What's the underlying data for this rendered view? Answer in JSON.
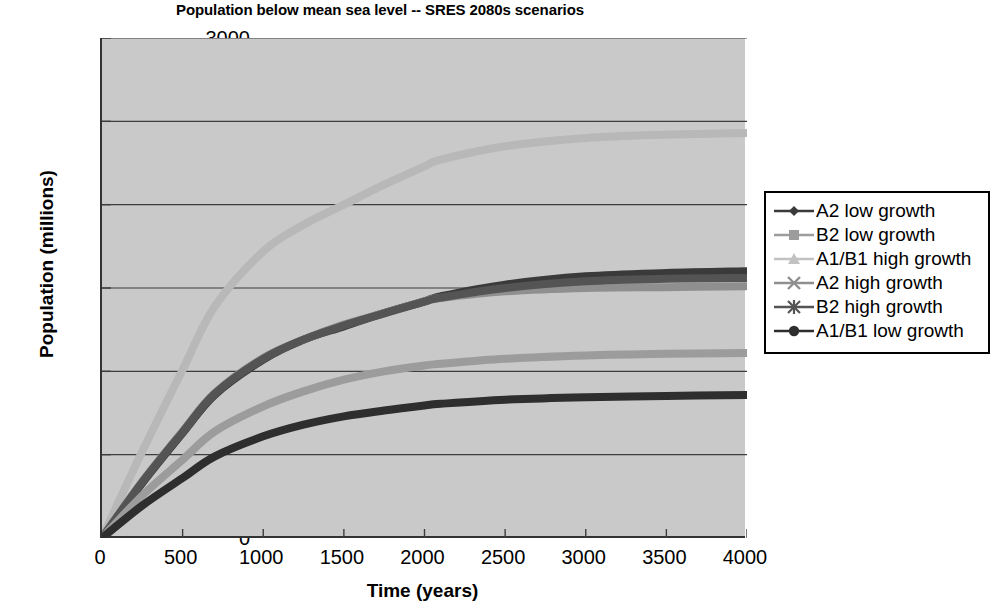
{
  "chart_data": {
    "type": "line",
    "title": "Population below mean sea level -- SRES 2080s scenarios",
    "xlabel": "Time (years)",
    "ylabel": "Population (millions)",
    "xlim": [
      0,
      4000
    ],
    "ylim": [
      0,
      3000
    ],
    "xticks": [
      0,
      500,
      1000,
      1500,
      2000,
      2500,
      3000,
      3500,
      4000
    ],
    "yticks": [
      0,
      500,
      1000,
      1500,
      2000,
      2500,
      3000
    ],
    "grid": "horizontal",
    "legend_position": "right",
    "plot_background": "#c9c9c9",
    "x": [
      0,
      250,
      500,
      700,
      1000,
      1250,
      1500,
      1750,
      2000,
      2100,
      2500,
      3000,
      3500,
      4000
    ],
    "series": [
      {
        "name": "A1/B1 high growth",
        "marker": "triangle",
        "color": "#b8b8b8",
        "values": [
          0,
          520,
          1010,
          1390,
          1720,
          1880,
          2000,
          2120,
          2230,
          2270,
          2350,
          2400,
          2420,
          2430
        ]
      },
      {
        "name": "A2 low growth",
        "marker": "diamond",
        "color": "#3a3a3a",
        "values": [
          0,
          330,
          630,
          860,
          1070,
          1190,
          1270,
          1350,
          1420,
          1450,
          1520,
          1570,
          1590,
          1600
        ]
      },
      {
        "name": "A2 high growth",
        "marker": "x",
        "color": "#8f8f8f",
        "values": [
          0,
          340,
          640,
          870,
          1080,
          1190,
          1280,
          1350,
          1420,
          1440,
          1480,
          1500,
          1505,
          1510
        ]
      },
      {
        "name": "B2 high growth",
        "marker": "asterisk",
        "color": "#545454",
        "values": [
          0,
          335,
          635,
          865,
          1075,
          1190,
          1275,
          1348,
          1418,
          1442,
          1500,
          1540,
          1555,
          1560
        ]
      },
      {
        "name": "B2 low growth",
        "marker": "square",
        "color": "#9c9c9c",
        "values": [
          0,
          255,
          470,
          640,
          790,
          880,
          950,
          1000,
          1035,
          1045,
          1075,
          1095,
          1105,
          1110
        ]
      },
      {
        "name": "A1/B1 low growth",
        "marker": "circle",
        "color": "#2e2e2e",
        "values": [
          0,
          195,
          360,
          490,
          610,
          680,
          730,
          765,
          795,
          805,
          830,
          845,
          852,
          858
        ]
      }
    ]
  },
  "axis": {
    "yticks": [
      "3000",
      "2500",
      "2000",
      "1500",
      "1000",
      "500",
      "0"
    ],
    "xticks": [
      "0",
      "500",
      "1000",
      "1500",
      "2000",
      "2500",
      "3000",
      "3500",
      "4000"
    ],
    "xlabel": "Time (years)",
    "ylabel": "Population (millions)"
  },
  "legend": {
    "items": [
      {
        "label": "A2 low growth",
        "marker": "diamond",
        "color": "#3a3a3a"
      },
      {
        "label": "B2 low growth",
        "marker": "square",
        "color": "#9c9c9c"
      },
      {
        "label": "A1/B1 high growth",
        "marker": "triangle",
        "color": "#c2c2c2"
      },
      {
        "label": "A2 high growth",
        "marker": "x",
        "color": "#8f8f8f"
      },
      {
        "label": "B2 high growth",
        "marker": "asterisk",
        "color": "#545454"
      },
      {
        "label": "A1/B1 low growth",
        "marker": "circle",
        "color": "#2e2e2e"
      }
    ]
  }
}
